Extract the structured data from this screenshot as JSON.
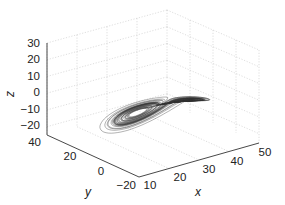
{
  "chart_data": {
    "type": "line",
    "subtype": "3d-trajectory",
    "title": "",
    "xlabel": "x",
    "ylabel": "y",
    "zlabel": "z",
    "xlim": [
      10,
      50
    ],
    "ylim": [
      -20,
      40
    ],
    "zlim": [
      -20,
      30
    ],
    "x_ticks": [
      "10",
      "20",
      "30",
      "40",
      "50"
    ],
    "y_ticks": [
      "-20",
      "0",
      "20",
      "40"
    ],
    "z_ticks": [
      "-20",
      "-10",
      "0",
      "10",
      "20",
      "30"
    ],
    "grid": true,
    "legend": null,
    "series": [
      {
        "name": "trajectory",
        "color": "#333333",
        "lobes": [
          {
            "center_approx": {
              "z": 5
            },
            "position": "upper"
          },
          {
            "center_approx": {
              "z": -20
            },
            "position": "lower"
          }
        ]
      }
    ]
  },
  "axes": {
    "x": {
      "label": "x",
      "ticks": [
        "10",
        "20",
        "30",
        "40",
        "50"
      ]
    },
    "y": {
      "label": "y",
      "ticks": [
        "−20",
        "0",
        "20",
        "40"
      ]
    },
    "z": {
      "label": "z",
      "ticks": [
        "30",
        "20",
        "10",
        "0",
        "−10",
        "−20"
      ]
    }
  }
}
